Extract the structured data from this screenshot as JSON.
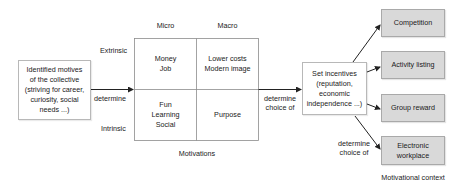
{
  "diagram": {
    "source_box": {
      "text": "Identified motives\nof the collective\n(striving for career,\ncuriosity, social\nneeds ...)"
    },
    "edge_source_to_grid": {
      "label": "determine"
    },
    "grid": {
      "column_headers": [
        "Micro",
        "Macro"
      ],
      "row_headers": [
        "Extrinsic",
        "Intrinsic"
      ],
      "cells": {
        "extrinsic_micro": "Money\nJob",
        "extrinsic_macro": "Lower costs\nModern image",
        "intrinsic_micro": "Fun\nLearning\nSocial",
        "intrinsic_macro": "Purpose"
      },
      "caption": "Motivations"
    },
    "edge_grid_to_incentives": {
      "label": "determine\nchoice of"
    },
    "incentives_box": {
      "text": "Set incentives\n(reputation,\neconomic\nindependence ...)"
    },
    "edge_incentives_to_context": {
      "label": "determine\nchoice of"
    },
    "context_boxes": [
      {
        "label": "Competition"
      },
      {
        "label": "Activity listing"
      },
      {
        "label": "Group reward"
      },
      {
        "label": "Electronic\nworkplace"
      }
    ],
    "context_caption": "Motivational context",
    "colors": {
      "grey_box_fill": "#d9d9d9",
      "grey_box_border": "#a9a9a9",
      "line": "#222222",
      "grid_line": "#8c8c8c"
    }
  }
}
